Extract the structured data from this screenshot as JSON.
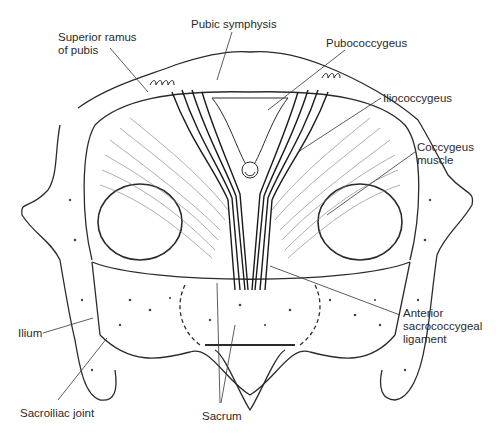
{
  "figure": {
    "labels": [
      {
        "id": "superior-ramus",
        "text_lines": [
          "Superior ramus",
          "of pubis"
        ],
        "x": 58,
        "y": 31
      },
      {
        "id": "pubic-symphysis",
        "text_lines": [
          "Pubic symphysis"
        ],
        "x": 191,
        "y": 18
      },
      {
        "id": "pubococcygeus",
        "text_lines": [
          "Pubococcygeus"
        ],
        "x": 326,
        "y": 37
      },
      {
        "id": "iliococcygeus",
        "text_lines": [
          "Iliococcygeus"
        ],
        "x": 383,
        "y": 92
      },
      {
        "id": "coccygeus",
        "text_lines": [
          "Coccygeus",
          "muscle"
        ],
        "x": 417,
        "y": 141
      },
      {
        "id": "anterior-sacrococcygeal",
        "text_lines": [
          "Anterior",
          "sacrococcygeal",
          "ligament"
        ],
        "x": 403,
        "y": 307
      },
      {
        "id": "ilium",
        "text_lines": [
          "Ilium"
        ],
        "x": 18,
        "y": 327
      },
      {
        "id": "sacroiliac-joint",
        "text_lines": [
          "Sacroiliac joint"
        ],
        "x": 20,
        "y": 407
      },
      {
        "id": "sacrum",
        "text_lines": [
          "Sacrum"
        ],
        "x": 202,
        "y": 410
      }
    ],
    "caption": "",
    "colors": {
      "ink": "#2a2a2a",
      "bone_fill": "#ffffff",
      "muscle_dark": "#1a1a1a",
      "muscle_light": "#555555"
    }
  }
}
